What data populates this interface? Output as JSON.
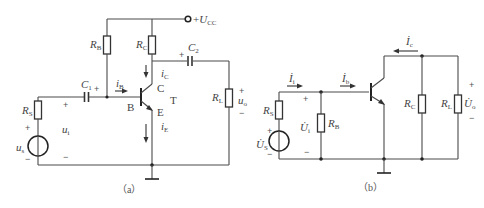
{
  "figure_a": {
    "caption": "（a）",
    "supply": {
      "prefix": "+",
      "symbol": "U",
      "sub": "CC"
    },
    "resistors": {
      "rb": {
        "symbol": "R",
        "sub": "B"
      },
      "rc": {
        "symbol": "R",
        "sub": "C"
      },
      "rs": {
        "symbol": "R",
        "sub": "S"
      },
      "rl": {
        "symbol": "R",
        "sub": "L"
      }
    },
    "capacitors": {
      "c1": {
        "symbol": "C",
        "sub": "1"
      },
      "c2": {
        "symbol": "C",
        "sub": "2"
      }
    },
    "transistor": {
      "name": "T",
      "base": "B",
      "collector": "C",
      "emitter": "E"
    },
    "currents": {
      "ib": {
        "symbol": "i",
        "sub": "B"
      },
      "ic": {
        "symbol": "i",
        "sub": "C"
      },
      "ie": {
        "symbol": "i",
        "sub": "E"
      }
    },
    "voltages": {
      "us": {
        "symbol": "u",
        "sub": "s"
      },
      "ui": {
        "symbol": "u",
        "sub": "i"
      },
      "uo": {
        "symbol": "u",
        "sub": "o"
      }
    },
    "plus": "+",
    "minus": "−"
  },
  "figure_b": {
    "caption": "（b）",
    "resistors": {
      "rs": {
        "symbol": "R",
        "sub": "S"
      },
      "rb": {
        "symbol": "R",
        "sub": "B"
      },
      "rc": {
        "symbol": "R",
        "sub": "C"
      },
      "rl": {
        "symbol": "R",
        "sub": "L"
      }
    },
    "currents": {
      "ii": {
        "symbol": "İ",
        "sub": "i"
      },
      "ib": {
        "symbol": "İ",
        "sub": "b"
      },
      "ic": {
        "symbol": "İ",
        "sub": "c"
      }
    },
    "voltages": {
      "us": {
        "symbol": "U̇",
        "sub": "S"
      },
      "ui": {
        "symbol": "U̇",
        "sub": "i"
      },
      "uo": {
        "symbol": "U̇",
        "sub": "o"
      }
    },
    "plus": "+",
    "minus": "−"
  }
}
